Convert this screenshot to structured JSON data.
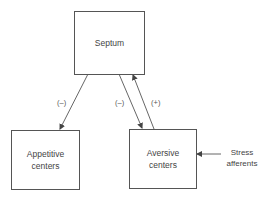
{
  "nodes": {
    "septum": {
      "label": "Septum"
    },
    "appetitive": {
      "label_line1": "Appetitive",
      "label_line2": "centers"
    },
    "aversive": {
      "label_line1": "Aversive",
      "label_line2": "centers"
    }
  },
  "edges": [
    {
      "from": "septum",
      "to": "appetitive",
      "sign": "(–)"
    },
    {
      "from": "septum",
      "to": "aversive",
      "sign": "(–)"
    },
    {
      "from": "aversive",
      "to": "septum",
      "sign": "(+)"
    },
    {
      "from": "stress_afferents",
      "to": "aversive",
      "sign": ""
    }
  ],
  "external_input": {
    "line1": "Stress",
    "line2": "afferents"
  },
  "colors": {
    "line": "#555555",
    "text": "#444444",
    "background": "#ffffff"
  }
}
